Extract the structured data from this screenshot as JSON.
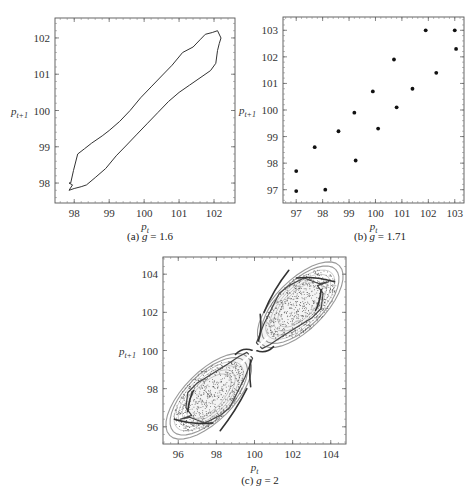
{
  "chart_data": [
    {
      "id": "a",
      "type": "line",
      "caption": "(a) g = 1.6",
      "caption_prefix": "(a)",
      "caption_var": "g",
      "caption_value": "= 1.6",
      "xlabel": "p_t",
      "ylabel": "p_{t+1}",
      "xlim": [
        97.45,
        102.6
      ],
      "ylim": [
        97.45,
        102.55
      ],
      "xticks": [
        98,
        99,
        100,
        101,
        102
      ],
      "yticks": [
        98,
        99,
        100,
        101,
        102
      ],
      "grid": false,
      "series": [
        {
          "name": "invariant closed curve",
          "closed": true,
          "x": [
            97.9,
            97.98,
            98.1,
            98.3,
            98.5,
            98.8,
            99.0,
            99.3,
            99.6,
            99.9,
            100.2,
            100.5,
            100.8,
            101.1,
            101.4,
            101.6,
            101.75,
            101.95,
            102.1,
            102.2,
            102.15,
            102.1,
            102.05,
            101.9,
            101.6,
            101.3,
            101.0,
            100.7,
            100.4,
            100.1,
            99.8,
            99.5,
            99.2,
            98.9,
            98.6,
            98.35,
            98.2,
            98.0,
            97.85,
            97.95,
            97.85
          ],
          "y": [
            98.0,
            98.35,
            98.8,
            98.95,
            99.1,
            99.3,
            99.45,
            99.7,
            100.0,
            100.35,
            100.65,
            100.95,
            101.25,
            101.6,
            101.75,
            101.95,
            102.1,
            102.15,
            102.2,
            102.0,
            101.85,
            101.65,
            101.3,
            101.1,
            100.9,
            100.7,
            100.5,
            100.25,
            99.95,
            99.65,
            99.35,
            99.05,
            98.75,
            98.4,
            98.15,
            97.95,
            97.9,
            97.85,
            97.8,
            97.95,
            98.0
          ]
        }
      ]
    },
    {
      "id": "b",
      "type": "scatter",
      "caption": "(b) g = 1.71",
      "caption_prefix": "(b)",
      "caption_var": "g",
      "caption_value": "= 1.71",
      "xlabel": "p_t",
      "ylabel": "p_{t+1}",
      "xlim": [
        96.5,
        103.35
      ],
      "ylim": [
        96.5,
        103.5
      ],
      "xticks": [
        97,
        98,
        99,
        100,
        101,
        102,
        103
      ],
      "yticks": [
        97,
        98,
        99,
        100,
        101,
        102,
        103
      ],
      "grid": false,
      "series": [
        {
          "name": "periodic orbit points",
          "x": [
            97.0,
            97.0,
            97.7,
            98.1,
            98.6,
            99.25,
            99.2,
            99.9,
            100.1,
            100.7,
            100.8,
            101.4,
            101.9,
            102.3,
            103.0,
            103.05
          ],
          "y": [
            97.7,
            96.95,
            98.6,
            97.0,
            99.2,
            98.1,
            99.9,
            100.7,
            99.3,
            101.9,
            100.1,
            100.8,
            103.0,
            101.4,
            103.0,
            102.3
          ]
        }
      ]
    },
    {
      "id": "c",
      "type": "scatter",
      "caption": "(c) g = 2",
      "caption_prefix": "(c)",
      "caption_var": "g",
      "caption_value": "= 2",
      "xlabel": "p_t",
      "ylabel": "p_{t+1}",
      "xlim": [
        95.2,
        104.8
      ],
      "ylim": [
        95.1,
        104.9
      ],
      "xticks": [
        96,
        98,
        100,
        102,
        104
      ],
      "yticks": [
        96,
        98,
        100,
        102,
        104
      ],
      "grid": false,
      "description": "Strange attractor: two dense lobes along the diagonal, lower-left centred near (97.5, 97.5) and upper-right near (102.5, 102.5), pinched near (100, 100), with thin arcs/spikes around each lobe.",
      "series": [
        {
          "name": "lower-left lobe outline",
          "x": [
            96.1,
            96.6,
            97.4,
            98.2,
            98.7,
            99.1,
            99.5,
            99.9,
            99.6,
            99.2,
            98.6,
            97.8,
            97.0,
            96.5,
            96.4,
            96.7,
            96.1
          ],
          "y": [
            96.4,
            96.5,
            96.2,
            96.6,
            97.0,
            97.8,
            98.6,
            99.6,
            99.9,
            99.7,
            99.3,
            98.8,
            98.3,
            97.8,
            97.0,
            96.6,
            96.4
          ]
        },
        {
          "name": "upper-right lobe outline",
          "x": [
            103.9,
            103.4,
            102.6,
            101.8,
            101.3,
            100.9,
            100.5,
            100.1,
            100.4,
            100.8,
            101.4,
            102.2,
            103.0,
            103.5,
            103.6,
            103.3,
            103.9
          ],
          "y": [
            103.6,
            103.5,
            103.8,
            103.4,
            103.0,
            102.2,
            101.4,
            100.4,
            100.1,
            100.3,
            100.7,
            101.2,
            101.7,
            102.2,
            103.0,
            103.4,
            103.6
          ]
        }
      ]
    }
  ]
}
